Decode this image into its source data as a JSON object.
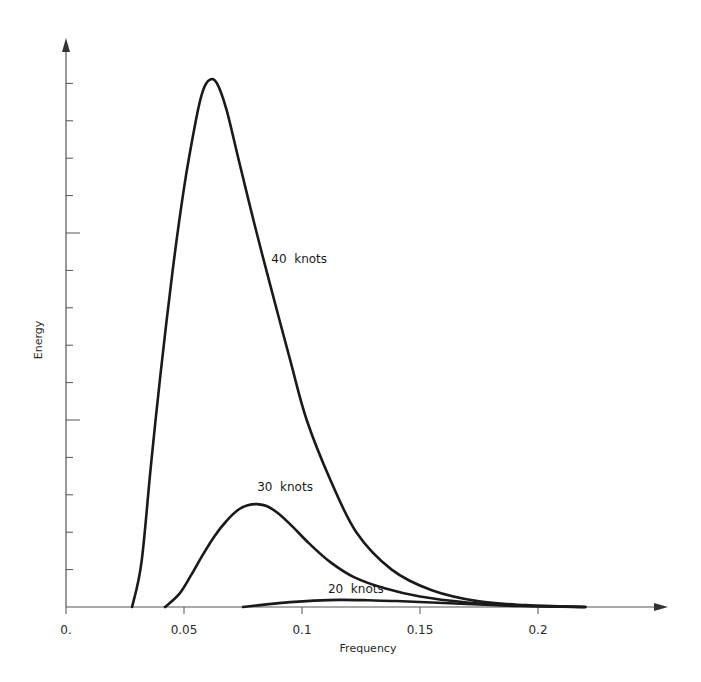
{
  "chart_data": {
    "type": "line",
    "title": "",
    "xlabel": "Frequency",
    "ylabel": "Energy",
    "xlim": [
      0,
      0.25
    ],
    "ylim": [
      0,
      14.5
    ],
    "x_ticks": [
      "0.",
      "0.05",
      "0.1",
      "0.15",
      "0.2"
    ],
    "x_tick_values": [
      0,
      0.05,
      0.1,
      0.15,
      0.2
    ],
    "y_ticks_unlabeled": 14,
    "y_major_ticks": [
      5,
      10
    ],
    "grid": false,
    "legend": "inline labels",
    "series": [
      {
        "name": "40 knots",
        "label_pos": {
          "x": 0.087,
          "y": 9.2
        },
        "x": [
          0.028,
          0.032,
          0.036,
          0.04,
          0.045,
          0.05,
          0.055,
          0.058,
          0.061,
          0.064,
          0.068,
          0.073,
          0.08,
          0.087,
          0.095,
          0.102,
          0.112,
          0.123,
          0.138,
          0.155,
          0.175,
          0.195,
          0.22
        ],
        "y": [
          0.0,
          1.2,
          3.8,
          6.2,
          8.9,
          11.2,
          13.0,
          13.8,
          14.1,
          14.0,
          13.3,
          12.0,
          10.2,
          8.5,
          6.6,
          5.0,
          3.4,
          2.0,
          1.0,
          0.45,
          0.15,
          0.05,
          0.0
        ]
      },
      {
        "name": "30 knots",
        "label_pos": {
          "x": 0.081,
          "y": 3.1
        },
        "x": [
          0.042,
          0.048,
          0.053,
          0.058,
          0.063,
          0.068,
          0.073,
          0.077,
          0.081,
          0.085,
          0.09,
          0.096,
          0.103,
          0.112,
          0.122,
          0.135,
          0.15,
          0.17,
          0.19,
          0.22
        ],
        "y": [
          0.0,
          0.35,
          0.85,
          1.4,
          1.9,
          2.3,
          2.6,
          2.72,
          2.75,
          2.7,
          2.5,
          2.15,
          1.7,
          1.2,
          0.8,
          0.5,
          0.28,
          0.12,
          0.04,
          0.0
        ]
      },
      {
        "name": "20 knots",
        "label_pos": {
          "x": 0.111,
          "y": 0.38
        },
        "x": [
          0.075,
          0.085,
          0.095,
          0.105,
          0.116,
          0.128,
          0.14,
          0.155,
          0.17,
          0.185,
          0.2,
          0.22
        ],
        "y": [
          0.0,
          0.07,
          0.13,
          0.17,
          0.19,
          0.18,
          0.16,
          0.12,
          0.08,
          0.04,
          0.02,
          0.0
        ]
      }
    ]
  },
  "axes": {
    "x_title": "Frequency",
    "y_title": "Energy"
  },
  "colors": {
    "curve": "#1a1a1a",
    "axis": "#555555",
    "text": "#2a2a2a",
    "background": "#ffffff"
  }
}
